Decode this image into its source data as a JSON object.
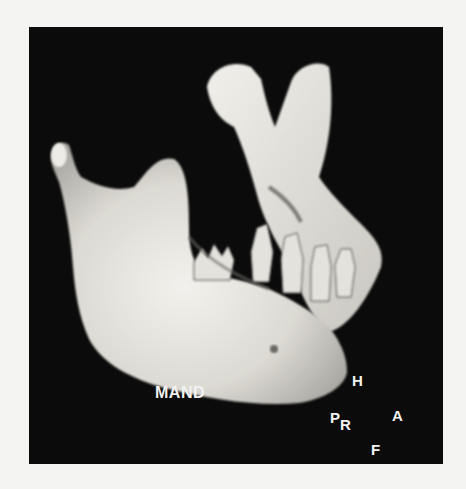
{
  "figure": {
    "background_color": "#0b0b0b",
    "bone_color": "#e8e6e0",
    "labels": {
      "structure": "MAND",
      "orientation": {
        "head": "H",
        "posterior": "P",
        "right": "R",
        "anterior": "A",
        "foot": "F"
      }
    }
  }
}
